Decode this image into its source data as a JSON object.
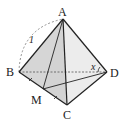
{
  "diagram": {
    "type": "tetrahedron",
    "vertices": {
      "A": {
        "label": "A",
        "x": 63,
        "y": 19
      },
      "B": {
        "label": "B",
        "x": 19,
        "y": 72
      },
      "C": {
        "label": "C",
        "x": 67,
        "y": 105
      },
      "D": {
        "label": "D",
        "x": 107,
        "y": 72
      },
      "M": {
        "label": "M",
        "x": 43,
        "y": 89
      }
    },
    "edge_label_AB": "1",
    "angle_label": "x",
    "hidden_edge": "BD",
    "segments": [
      "AB",
      "AC",
      "AD",
      "BC",
      "CD",
      "AM",
      "MD"
    ],
    "tick_marks": [
      "BM",
      "MC"
    ],
    "colors": {
      "face_fill": "#d9d9d9",
      "face_fill_light": "#ebebeb",
      "edge": "#222222",
      "hidden_edge": "#555555",
      "arc": "#777777"
    }
  }
}
